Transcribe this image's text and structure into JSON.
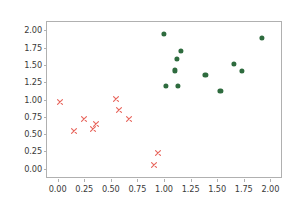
{
  "figure": {
    "width": 297,
    "height": 209,
    "background_color": "#ffffff",
    "axes_color": "#b0b0b0",
    "tick_label_color": "#3a3a3a"
  },
  "chart_data": {
    "type": "scatter",
    "title": "",
    "xlabel": "",
    "ylabel": "",
    "xlim": [
      -0.1,
      2.1
    ],
    "ylim": [
      -0.12,
      2.12
    ],
    "grid": false,
    "legend": null,
    "xticks": [
      0.0,
      0.25,
      0.5,
      0.75,
      1.0,
      1.25,
      1.5,
      1.75,
      2.0
    ],
    "yticks": [
      0.0,
      0.25,
      0.5,
      0.75,
      1.0,
      1.25,
      1.5,
      1.75,
      2.0
    ],
    "xtick_labels": [
      "0.00",
      "0.25",
      "0.50",
      "0.75",
      "1.00",
      "1.25",
      "1.50",
      "1.75",
      "2.00"
    ],
    "ytick_labels": [
      "0.00",
      "0.25",
      "0.50",
      "0.75",
      "1.00",
      "1.25",
      "1.50",
      "1.75",
      "2.00"
    ],
    "series": [
      {
        "name": "class-0",
        "marker": "x",
        "color": "#e8685f",
        "points": [
          [
            0.02,
            0.96
          ],
          [
            0.15,
            0.54
          ],
          [
            0.25,
            0.72
          ],
          [
            0.33,
            0.57
          ],
          [
            0.36,
            0.64
          ],
          [
            0.55,
            1.01
          ],
          [
            0.58,
            0.85
          ],
          [
            0.67,
            0.72
          ],
          [
            0.91,
            0.05
          ],
          [
            0.94,
            0.22
          ]
        ]
      },
      {
        "name": "class-1",
        "marker": "o",
        "color": "#2e6b3e",
        "points": [
          [
            1.0,
            1.95
          ],
          [
            1.02,
            1.2
          ],
          [
            1.1,
            1.42
          ],
          [
            1.12,
            1.59
          ],
          [
            1.13,
            1.2
          ],
          [
            1.16,
            1.7
          ],
          [
            1.39,
            1.35
          ],
          [
            1.53,
            1.12
          ],
          [
            1.66,
            1.51
          ],
          [
            1.73,
            1.41
          ],
          [
            1.92,
            1.89
          ]
        ]
      }
    ]
  }
}
